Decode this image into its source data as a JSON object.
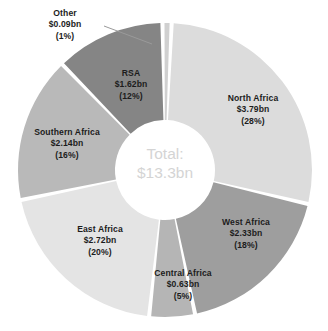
{
  "chart_data": {
    "type": "pie",
    "variant": "donut",
    "title": "",
    "center_label": {
      "line1": "Total:",
      "line2": "$13.3bn"
    },
    "total_value": 13.3,
    "unit": "bn",
    "currency": "$",
    "categories": [
      "North Africa",
      "West Africa",
      "Central Africa",
      "East Africa",
      "Southern Africa",
      "RSA",
      "Other"
    ],
    "values": [
      3.79,
      2.33,
      0.63,
      2.72,
      2.14,
      1.62,
      0.09
    ],
    "percentages": [
      28,
      18,
      5,
      20,
      16,
      12,
      1
    ],
    "legend_position": "none",
    "slices": [
      {
        "name": "North Africa",
        "value_text": "$3.79bn",
        "percent_text": "(28%)",
        "value": 3.79,
        "percent": 28,
        "color": "#dcdcdc",
        "start_deg": 2.6,
        "end_deg": 103.4,
        "label_leader": false
      },
      {
        "name": "West Africa",
        "value_text": "$2.33bn",
        "percent_text": "(18%)",
        "value": 2.33,
        "percent": 18,
        "color": "#9e9e9e",
        "start_deg": 103.4,
        "end_deg": 168.2,
        "label_leader": false
      },
      {
        "name": "Central Africa",
        "value_text": "$0.63bn",
        "percent_text": "(5%)",
        "value": 0.63,
        "percent": 5,
        "color": "#b5b5b5",
        "start_deg": 168.2,
        "end_deg": 186.2,
        "label_leader": false
      },
      {
        "name": "East Africa",
        "value_text": "$2.72bn",
        "percent_text": "(20%)",
        "value": 2.72,
        "percent": 20,
        "color": "#e4e4e4",
        "start_deg": 186.2,
        "end_deg": 258.2,
        "label_leader": false
      },
      {
        "name": "Southern Africa",
        "value_text": "$2.14bn",
        "percent_text": "(16%)",
        "value": 2.14,
        "percent": 16,
        "color": "#b9b9b9",
        "start_deg": 258.2,
        "end_deg": 315.8,
        "label_leader": false
      },
      {
        "name": "RSA",
        "value_text": "$1.62bn",
        "percent_text": "(12%)",
        "value": 1.62,
        "percent": 12,
        "color": "#858585",
        "start_deg": 315.8,
        "end_deg": 359.0,
        "label_leader": false
      },
      {
        "name": "Other",
        "value_text": "$0.09bn",
        "percent_text": "(1%)",
        "value": 0.09,
        "percent": 1,
        "color": "#d0d0d0",
        "start_deg": 359.0,
        "end_deg": 362.6,
        "label_leader": true
      }
    ],
    "geometry": {
      "cx": 165,
      "cy": 170,
      "outer_r": 147,
      "inner_r": 50,
      "gap_deg": 1.6
    },
    "background": "#ffffff",
    "label_color": "#1c1c1c",
    "center_text_color": "#d4d4d4"
  }
}
